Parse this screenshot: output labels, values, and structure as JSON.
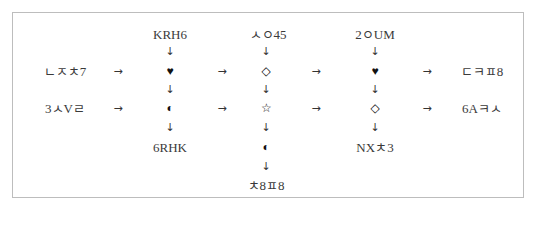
{
  "diagram": {
    "type": "symbol-transform-flow",
    "rows": [
      {
        "input_label": "ㄴㅈㅊ7",
        "output_label": "ㄷㅋㅍ8",
        "symbols": [
          "♥",
          "◇",
          "♥"
        ]
      },
      {
        "input_label": "3ㅅVㄹ",
        "output_label": "6Aㅋㅅ",
        "symbols": [
          "◐",
          "☆",
          "◇"
        ]
      }
    ],
    "columns": [
      {
        "top_label": "KRH6",
        "bottom_label": "6RHK",
        "extra_symbol": null,
        "extra_label": null
      },
      {
        "top_label": "ㅅㅇ45",
        "bottom_label": null,
        "extra_symbol": "◐",
        "extra_label": "ㅊ8ㅍ8"
      },
      {
        "top_label": "2ㅇUM",
        "bottom_label": "NXㅊ3",
        "extra_symbol": null,
        "extra_label": null
      }
    ],
    "arrows": {
      "right": "→",
      "down": "↓"
    }
  }
}
